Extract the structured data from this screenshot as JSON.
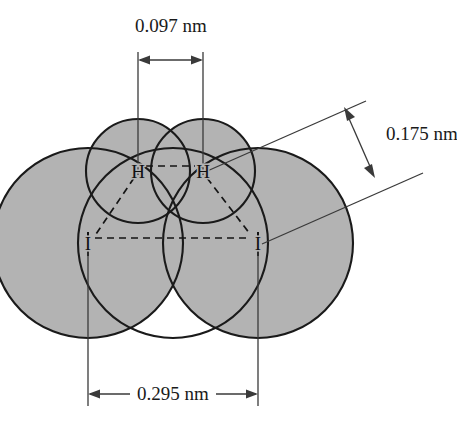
{
  "figure": {
    "type": "space-filling molecular diagram",
    "background_color": "#ffffff",
    "envelope_color": "#b3b3b3",
    "outline_color": "#1a1a1a",
    "dimension_line_color": "#3a3a3a"
  },
  "atoms": [
    {
      "id": "h-left",
      "label": "H",
      "x": 138,
      "y": 171
    },
    {
      "id": "h-right",
      "label": "H",
      "x": 203,
      "y": 171
    },
    {
      "id": "i-left",
      "label": "I",
      "x": 88,
      "y": 243
    },
    {
      "id": "i-right",
      "label": "I",
      "x": 258,
      "y": 243
    }
  ],
  "dimensions": {
    "hh": {
      "label": "0.097 nm",
      "text_x": 171,
      "text_y": 32,
      "arrow_y": 60,
      "from_x": 138,
      "to_x": 203
    },
    "hi": {
      "label": "0.175 nm",
      "text_x": 386,
      "text_y": 140,
      "arrow_from_x": 349,
      "arrow_from_y": 110,
      "arrow_to_x": 370,
      "arrow_to_y": 178
    },
    "ii": {
      "label": "0.295 nm",
      "text_x": 173,
      "text_y": 400,
      "arrow_y": 394,
      "from_x": 88,
      "to_x": 258
    }
  },
  "bonds": [
    {
      "id": "bond-h-h",
      "style": "dashed",
      "x1": 146,
      "y1": 166,
      "x2": 195,
      "y2": 166
    },
    {
      "id": "bond-i-i",
      "style": "dashed",
      "x1": 95,
      "y1": 238,
      "x2": 251,
      "y2": 238
    },
    {
      "id": "bond-hl-il",
      "style": "dashed",
      "x1": 134,
      "y1": 178,
      "x2": 95,
      "y2": 234
    },
    {
      "id": "bond-hr-ir",
      "style": "dashed",
      "x1": 207,
      "y1": 178,
      "x2": 251,
      "y2": 234
    }
  ],
  "spheres": [
    {
      "id": "iodine-left",
      "cx": 88,
      "cy": 243,
      "r": 95
    },
    {
      "id": "iodine-right",
      "cx": 258,
      "cy": 243,
      "r": 95
    },
    {
      "id": "carbon-bottom",
      "cx": 173,
      "cy": 243,
      "r": 95
    },
    {
      "id": "hydrogen-left",
      "cx": 138,
      "cy": 171,
      "r": 52
    },
    {
      "id": "hydrogen-right",
      "cx": 203,
      "cy": 171,
      "r": 52
    }
  ]
}
